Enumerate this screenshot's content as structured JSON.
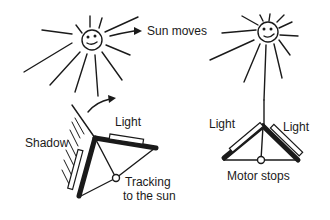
{
  "diagram": {
    "left_panel": {
      "sun_label": "Sun moves",
      "shadow_label": "Shadow",
      "light_label": "Light",
      "tracking_line1": "Tracking",
      "tracking_line2": "to the sun"
    },
    "right_panel": {
      "light_left_label": "Light",
      "light_right_label": "Light",
      "motor_label": "Motor stops"
    }
  },
  "colors": {
    "ink": "#1a1a1a",
    "background": "#ffffff"
  }
}
